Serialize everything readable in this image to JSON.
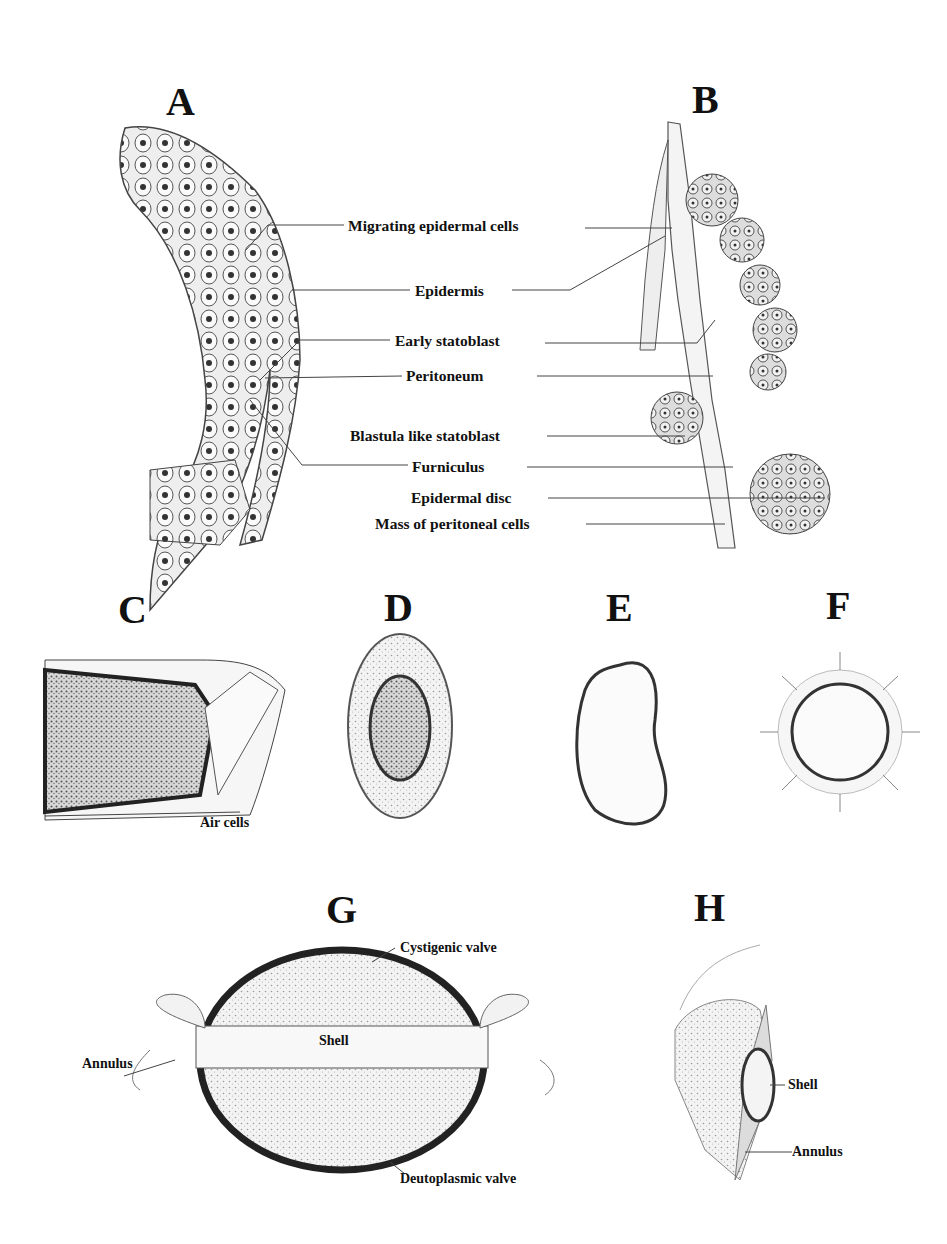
{
  "figure": {
    "panels": {
      "A": {
        "letter": "A"
      },
      "B": {
        "letter": "B"
      },
      "C": {
        "letter": "C",
        "labels": [
          "Air cells"
        ]
      },
      "D": {
        "letter": "D"
      },
      "E": {
        "letter": "E"
      },
      "F": {
        "letter": "F"
      },
      "G": {
        "letter": "G",
        "labels": [
          "Cystigenic valve",
          "Shell",
          "Annulus",
          "Deutoplasmic valve"
        ]
      },
      "H": {
        "letter": "H",
        "labels": [
          "Shell",
          "Annulus"
        ]
      }
    },
    "ab_labels": [
      "Migrating epidermal cells",
      "Epidermis",
      "Early statoblast",
      "Peritoneum",
      "Blastula like statoblast",
      "Furniculus",
      "Epidermal disc",
      "Mass of peritoneal cells"
    ],
    "colors": {
      "ink": "#1a1a1a",
      "stipple": "#c8c8c8",
      "background": "#ffffff"
    }
  }
}
